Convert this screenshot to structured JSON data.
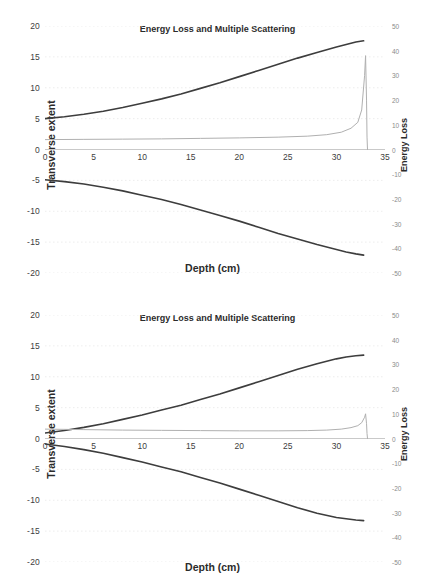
{
  "figure": {
    "caption_none": "",
    "background": "#ffffff",
    "curve_color": "#3d3d3d",
    "bragg_color": "#b0b0b0",
    "grid_color": "#e9e9e9"
  },
  "charts": [
    {
      "id": "chart-top",
      "title": "Energy Loss and Multiple Scattering",
      "xlabel": "Depth (cm)",
      "ylabel_left": "Transverse extent",
      "ylabel_right": "Energy Loss"
    },
    {
      "id": "chart-bottom",
      "title": "Energy Loss and Multiple Scattering",
      "xlabel": "Depth (cm)",
      "ylabel_left": "Transverse extent",
      "ylabel_right": "Energy Loss"
    }
  ],
  "chart_data": [
    {
      "type": "line",
      "title": "Energy Loss and Multiple Scattering",
      "xlabel": "Depth (cm)",
      "ylabel": "Transverse extent",
      "ylabel_secondary": "Energy Loss",
      "xlim": [
        0,
        35
      ],
      "ylim": [
        -20,
        20
      ],
      "ylim_secondary": [
        -50,
        50
      ],
      "xticks": [
        0,
        5,
        10,
        15,
        20,
        25,
        30,
        35
      ],
      "yticks": [
        20,
        15,
        10,
        5,
        0,
        -5,
        -10,
        -15,
        -20
      ],
      "yticks_secondary": [
        50,
        40,
        30,
        20,
        10,
        0,
        -10,
        -20,
        -30,
        -40,
        -50
      ],
      "grid": true,
      "legend": "none",
      "series": [
        {
          "name": "Upper scattering envelope",
          "axis": "left",
          "x": [
            0,
            2,
            4,
            6,
            8,
            10,
            12,
            14,
            16,
            18,
            20,
            22,
            24,
            26,
            28,
            30,
            31,
            32,
            32.8
          ],
          "values": [
            5.0,
            5.3,
            5.7,
            6.2,
            6.8,
            7.5,
            8.2,
            9.0,
            9.9,
            10.8,
            11.8,
            12.8,
            13.8,
            14.8,
            15.7,
            16.6,
            17.0,
            17.4,
            17.6
          ]
        },
        {
          "name": "Lower scattering envelope",
          "axis": "left",
          "x": [
            0,
            2,
            4,
            6,
            8,
            10,
            12,
            14,
            16,
            18,
            20,
            22,
            24,
            26,
            28,
            30,
            31,
            32,
            32.8
          ],
          "values": [
            -4.9,
            -5.2,
            -5.6,
            -6.1,
            -6.7,
            -7.4,
            -8.1,
            -8.9,
            -9.8,
            -10.7,
            -11.6,
            -12.6,
            -13.6,
            -14.5,
            -15.4,
            -16.2,
            -16.6,
            -16.9,
            -17.1
          ]
        },
        {
          "name": "Bragg depth-dose curve",
          "axis": "right",
          "x": [
            0,
            4,
            8,
            12,
            16,
            20,
            24,
            27,
            29,
            30.5,
            31.5,
            32.2,
            32.6,
            32.9,
            33.0,
            33.1,
            33.15,
            33.2
          ],
          "values": [
            4.0,
            4.1,
            4.2,
            4.3,
            4.5,
            4.7,
            5.0,
            5.4,
            6.0,
            7.0,
            8.6,
            11.0,
            16.0,
            30.0,
            38.0,
            20.0,
            5.0,
            0.0
          ]
        }
      ]
    },
    {
      "type": "line",
      "title": "Energy Loss and Multiple Scattering",
      "xlabel": "Depth (cm)",
      "ylabel": "Transverse extent",
      "ylabel_secondary": "Energy Loss",
      "xlim": [
        0,
        35
      ],
      "ylim": [
        -20,
        20
      ],
      "ylim_secondary": [
        -50,
        50
      ],
      "xticks": [
        0,
        5,
        10,
        15,
        20,
        25,
        30,
        35
      ],
      "yticks": [
        20,
        15,
        10,
        5,
        0,
        -5,
        -10,
        -15,
        -20
      ],
      "yticks_secondary": [
        50,
        40,
        30,
        20,
        10,
        0,
        -10,
        -20,
        -30,
        -40,
        -50
      ],
      "grid": true,
      "legend": "none",
      "series": [
        {
          "name": "Upper scattering envelope",
          "axis": "left",
          "x": [
            0,
            2,
            4,
            6,
            8,
            10,
            12,
            14,
            16,
            18,
            20,
            22,
            24,
            26,
            28,
            30,
            31,
            32,
            32.8
          ],
          "values": [
            0.9,
            1.3,
            1.8,
            2.4,
            3.1,
            3.8,
            4.6,
            5.4,
            6.3,
            7.2,
            8.2,
            9.2,
            10.2,
            11.2,
            12.1,
            12.9,
            13.2,
            13.4,
            13.5
          ]
        },
        {
          "name": "Lower scattering envelope",
          "axis": "left",
          "x": [
            0,
            2,
            4,
            6,
            8,
            10,
            12,
            14,
            16,
            18,
            20,
            22,
            24,
            26,
            28,
            30,
            31,
            32,
            32.8
          ],
          "values": [
            -0.9,
            -1.3,
            -1.8,
            -2.4,
            -3.1,
            -3.8,
            -4.6,
            -5.4,
            -6.3,
            -7.2,
            -8.2,
            -9.2,
            -10.2,
            -11.2,
            -12.1,
            -12.8,
            -13.0,
            -13.2,
            -13.3
          ]
        },
        {
          "name": "Bragg depth-dose curve",
          "axis": "right",
          "x": [
            0,
            4,
            8,
            12,
            16,
            20,
            24,
            27,
            29,
            30.5,
            31.5,
            32.2,
            32.6,
            32.9,
            33.0,
            33.1,
            33.15,
            33.2
          ],
          "values": [
            3.8,
            3.6,
            3.4,
            3.3,
            3.2,
            3.1,
            3.1,
            3.2,
            3.4,
            3.8,
            4.4,
            5.2,
            6.4,
            8.6,
            10.0,
            6.0,
            2.0,
            0.0
          ]
        }
      ]
    }
  ]
}
